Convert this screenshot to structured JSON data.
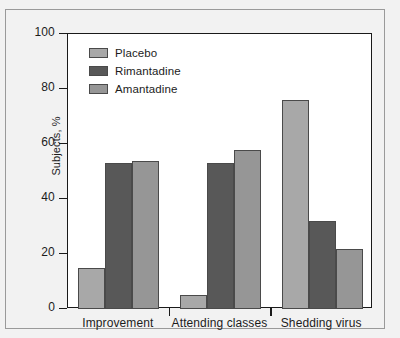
{
  "chart_data": {
    "type": "bar",
    "title": "",
    "xlabel": "",
    "ylabel": "Subjects, %",
    "ylim": [
      0,
      100
    ],
    "yticks": [
      0,
      20,
      40,
      60,
      80,
      100
    ],
    "grid": false,
    "legend_position": "top-left",
    "categories": [
      "Improvement",
      "Attending classes",
      "Shedding virus"
    ],
    "series": [
      {
        "name": "Placebo",
        "color": "#a8a8a8",
        "values": [
          15,
          5,
          76
        ]
      },
      {
        "name": "Rimantadine",
        "color": "#585858",
        "values": [
          53,
          53,
          32
        ]
      },
      {
        "name": "Amantadine",
        "color": "#969696",
        "values": [
          54,
          58,
          22
        ]
      }
    ]
  },
  "axis": {
    "ytick_labels": [
      "100",
      "80",
      "60",
      "40",
      "20",
      "0"
    ],
    "ylabel_text": "Subjects, %"
  },
  "legend": {
    "entries": [
      {
        "label": "Placebo"
      },
      {
        "label": "Rimantadine"
      },
      {
        "label": "Amantadine"
      }
    ]
  },
  "colors": {
    "placebo": "#a8a8a8",
    "rimantadine": "#585858",
    "amantadine": "#969696",
    "axis": "#1a1a1a",
    "panel_background": "#ffffff",
    "figure_background": "#f2f2f2",
    "bar_outline": "#4a4a4a"
  }
}
